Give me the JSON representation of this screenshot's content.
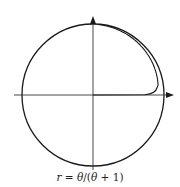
{
  "diagram": {
    "type": "polar-curve",
    "caption": {
      "lhs": "r",
      "equals": " = ",
      "rhs_theta1": "θ",
      "rhs_rest": "/(",
      "rhs_theta2": "θ",
      "rhs_end": " + 1)"
    },
    "equation": "r = θ/(θ + 1)",
    "elements": [
      "x-axis with arrow",
      "y-axis with arrow",
      "unit circle (asymptote r=1)",
      "spiral curve r = θ/(θ+1)"
    ],
    "colors": {
      "stroke": "#1a1a1a",
      "background": "#ffffff"
    }
  }
}
